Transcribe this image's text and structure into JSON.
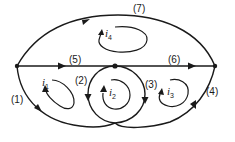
{
  "diagram": {
    "type": "circuit-graph",
    "branches": [
      {
        "id": "1",
        "label": "(1)"
      },
      {
        "id": "2",
        "label": "(2)"
      },
      {
        "id": "3",
        "label": "(3)"
      },
      {
        "id": "4",
        "label": "(4)"
      },
      {
        "id": "5",
        "label": "(5)"
      },
      {
        "id": "6",
        "label": "(6)"
      },
      {
        "id": "7",
        "label": "(7)"
      }
    ],
    "mesh_currents": [
      {
        "id": "i1",
        "symbol": "i",
        "subscript": "1"
      },
      {
        "id": "i2",
        "symbol": "i",
        "subscript": "2"
      },
      {
        "id": "i3",
        "symbol": "i",
        "subscript": "3"
      },
      {
        "id": "i4",
        "symbol": "i",
        "subscript": "4"
      }
    ],
    "nodes": [
      "left",
      "middle",
      "right",
      "bottom"
    ],
    "colors": {
      "ink": "#1a1a1a",
      "background": "#ffffff"
    }
  }
}
